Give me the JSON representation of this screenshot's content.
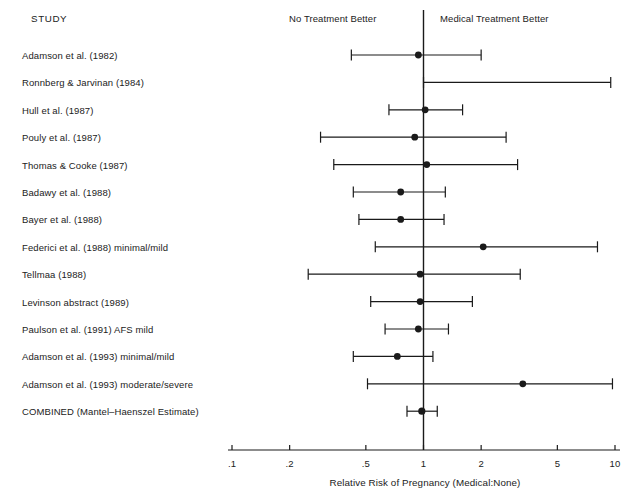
{
  "header": {
    "study_column": "STUDY",
    "left_region_label": "No Treatment Better",
    "right_region_label": "Medical Treatment Better"
  },
  "axis": {
    "title": "Relative Risk of Pregnancy (Medical:None)",
    "tick_labels": [
      ".1",
      ".2",
      ".5",
      "1",
      "2",
      "5",
      "10"
    ],
    "tick_values": [
      0.1,
      0.2,
      0.5,
      1,
      2,
      5,
      10
    ],
    "scale": "log10",
    "null_line_value": 1
  },
  "colors": {
    "ink": "#1a1a1a",
    "rule": "#2b2b2b",
    "background": "#ffffff"
  },
  "chart_data": {
    "type": "forest",
    "title": "",
    "xlabel": "Relative Risk of Pregnancy (Medical:None)",
    "ylabel": "",
    "xscale": "log",
    "xlim": [
      0.1,
      10
    ],
    "xticks": [
      0.1,
      0.2,
      0.5,
      1,
      2,
      5,
      10
    ],
    "xticklabels": [
      ".1",
      ".2",
      ".5",
      "1",
      "2",
      "5",
      "10"
    ],
    "reference_line": 1,
    "grid": false,
    "legend": null,
    "annotations": [
      "No Treatment Better",
      "Medical Treatment Better"
    ],
    "categories": [
      "Adamson et al. (1982)",
      "Ronnberg & Jarvinan (1984)",
      "Hull et al. (1987)",
      "Pouly et al. (1987)",
      "Thomas & Cooke (1987)",
      "Badawy et al. (1988)",
      "Bayer et al. (1988)",
      "Federici et al. (1988) minimal/mild",
      "Tellmaa (1988)",
      "Levinson abstract (1989)",
      "Paulson et al. (1991) AFS mild",
      "Adamson et al. (1993) minimal/mild",
      "Adamson et al. (1993) moderate/severe",
      "COMBINED (Mantel–Haenszel Estimate)"
    ],
    "rows": [
      {
        "label": "Adamson et al. (1982)",
        "estimate": 0.94,
        "ci_low": 0.42,
        "ci_high": 2.0,
        "point": true,
        "combined": false
      },
      {
        "label": "Ronnberg & Jarvinan (1984)",
        "estimate": null,
        "ci_low": 1.0,
        "ci_high": 9.5,
        "point": false,
        "combined": false
      },
      {
        "label": "Hull et al. (1987)",
        "estimate": 1.02,
        "ci_low": 0.66,
        "ci_high": 1.6,
        "point": true,
        "combined": false
      },
      {
        "label": "Pouly et al. (1987)",
        "estimate": 0.9,
        "ci_low": 0.29,
        "ci_high": 2.7,
        "point": true,
        "combined": false
      },
      {
        "label": "Thomas & Cooke (1987)",
        "estimate": 1.04,
        "ci_low": 0.34,
        "ci_high": 3.1,
        "point": true,
        "combined": false
      },
      {
        "label": "Badawy et al. (1988)",
        "estimate": 0.76,
        "ci_low": 0.43,
        "ci_high": 1.3,
        "point": true,
        "combined": false
      },
      {
        "label": "Bayer et al. (1988)",
        "estimate": 0.76,
        "ci_low": 0.46,
        "ci_high": 1.28,
        "point": true,
        "combined": false
      },
      {
        "label": "Federici et al. (1988) minimal/mild",
        "estimate": 2.05,
        "ci_low": 0.56,
        "ci_high": 8.1,
        "point": true,
        "combined": false
      },
      {
        "label": "Tellmaa (1988)",
        "estimate": 0.96,
        "ci_low": 0.25,
        "ci_high": 3.2,
        "point": true,
        "combined": false
      },
      {
        "label": "Levinson abstract (1989)",
        "estimate": 0.96,
        "ci_low": 0.53,
        "ci_high": 1.8,
        "point": true,
        "combined": false
      },
      {
        "label": "Paulson et al. (1991) AFS mild",
        "estimate": 0.94,
        "ci_low": 0.63,
        "ci_high": 1.35,
        "point": true,
        "combined": false
      },
      {
        "label": "Adamson et al. (1993) minimal/mild",
        "estimate": 0.73,
        "ci_low": 0.43,
        "ci_high": 1.12,
        "point": true,
        "combined": false
      },
      {
        "label": "Adamson et al. (1993) moderate/severe",
        "estimate": 3.3,
        "ci_low": 0.51,
        "ci_high": 9.7,
        "point": true,
        "combined": false
      },
      {
        "label": "COMBINED (Mantel–Haenszel Estimate)",
        "estimate": 0.98,
        "ci_low": 0.82,
        "ci_high": 1.18,
        "point": true,
        "combined": true
      }
    ]
  }
}
